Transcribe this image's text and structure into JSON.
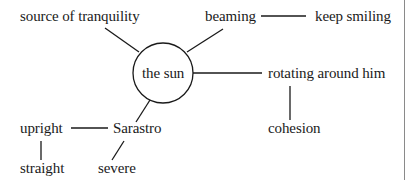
{
  "diagram": {
    "center": {
      "label": "the sun"
    },
    "nodes": {
      "source_of_tranquility": "source of tranquility",
      "beaming": "beaming",
      "keep_smiling": "keep smiling",
      "rotating_around_him": "rotating around him",
      "cohesion": "cohesion",
      "sarastro": "Sarastro",
      "upright": "upright",
      "straight": "straight",
      "severe": "severe"
    },
    "edges": [
      [
        "the sun",
        "source of tranquility"
      ],
      [
        "the sun",
        "beaming"
      ],
      [
        "beaming",
        "keep smiling"
      ],
      [
        "the sun",
        "rotating around him"
      ],
      [
        "rotating around him",
        "cohesion"
      ],
      [
        "the sun",
        "Sarastro"
      ],
      [
        "Sarastro",
        "upright"
      ],
      [
        "upright",
        "straight"
      ],
      [
        "Sarastro",
        "severe"
      ]
    ],
    "colors": {
      "ink": "#1a1a1a",
      "background": "#ffffff",
      "border": "#8a8a8a"
    }
  }
}
